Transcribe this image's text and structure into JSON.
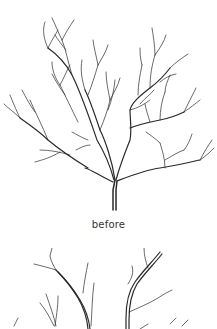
{
  "figures": [
    {
      "id": "before",
      "caption": "before",
      "subject": "tree-line-illustration"
    },
    {
      "id": "after",
      "caption": "",
      "subject": "tree-line-illustration-partial"
    }
  ],
  "colors": {
    "background": "#ffffff",
    "line": "#2a2a2a",
    "caption": "#333333"
  }
}
